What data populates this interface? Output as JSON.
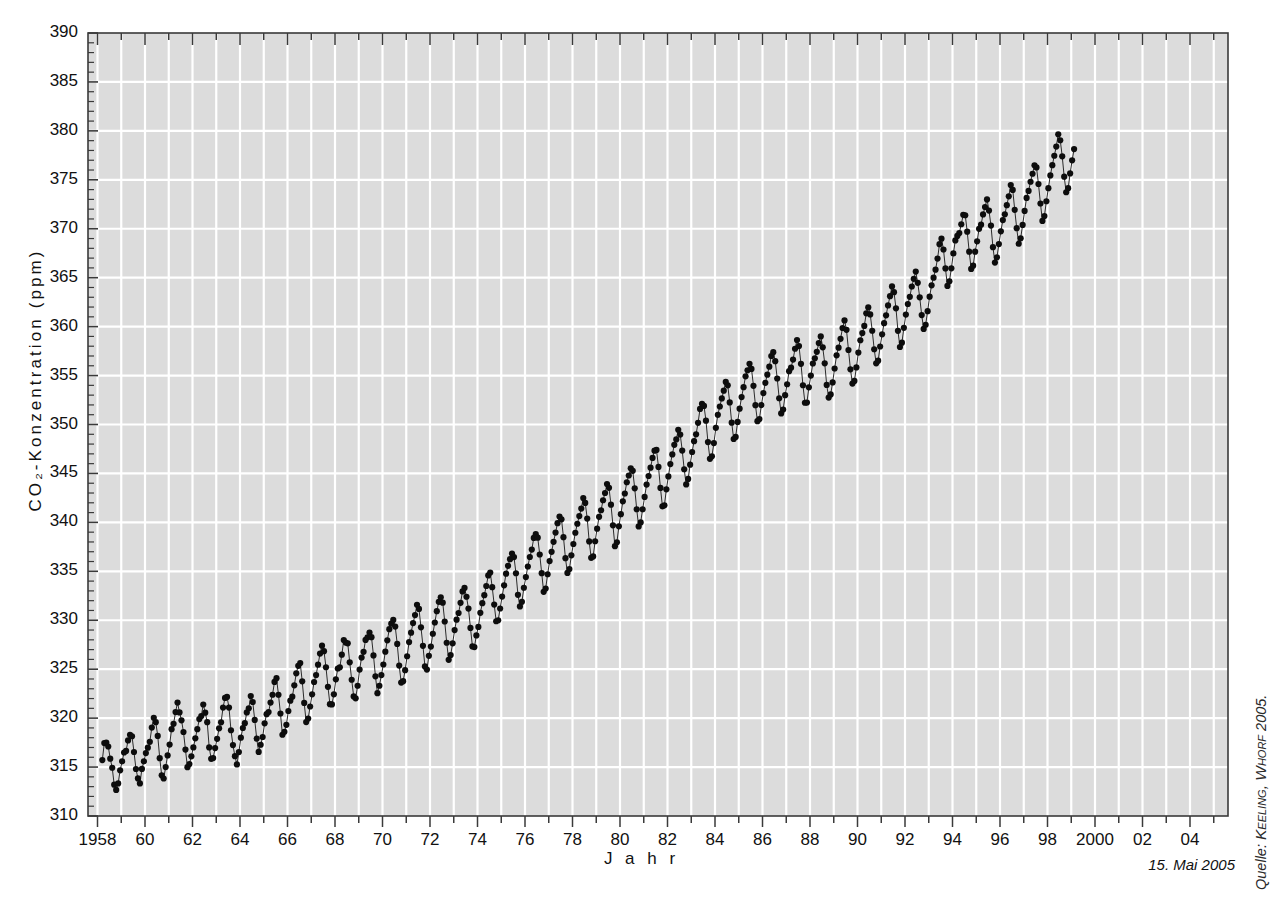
{
  "axes": {
    "y_title": "CO₂-Konzentration (ppm)",
    "x_title": "J a h r",
    "y_min": 310,
    "y_max": 390,
    "y_step": 5,
    "y_minor_step": 1,
    "y_ticks": [
      "310",
      "315",
      "320",
      "325",
      "330",
      "335",
      "340",
      "345",
      "350",
      "355",
      "360",
      "365",
      "370",
      "375",
      "380",
      "385",
      "390"
    ],
    "x_min": 1957.6,
    "x_max": 2005.6,
    "x_tick_years": [
      1958,
      1959,
      1960,
      1961,
      1962,
      1963,
      1964,
      1965,
      1966,
      1967,
      1968,
      1969,
      1970,
      1971,
      1972,
      1973,
      1974,
      1975,
      1976,
      1977,
      1978,
      1979,
      1980,
      1981,
      1982,
      1983,
      1984,
      1985,
      1986,
      1987,
      1988,
      1989,
      1990,
      1991,
      1992,
      1993,
      1994,
      1995,
      1996,
      1997,
      1998,
      1999,
      2000,
      2001,
      2002,
      2003,
      2004,
      2005
    ],
    "x_labeled": [
      {
        "year": 1958,
        "label": "1958"
      },
      {
        "year": 1960,
        "label": "60"
      },
      {
        "year": 1962,
        "label": "62"
      },
      {
        "year": 1964,
        "label": "64"
      },
      {
        "year": 1966,
        "label": "66"
      },
      {
        "year": 1968,
        "label": "68"
      },
      {
        "year": 1970,
        "label": "70"
      },
      {
        "year": 1972,
        "label": "72"
      },
      {
        "year": 1974,
        "label": "74"
      },
      {
        "year": 1976,
        "label": "76"
      },
      {
        "year": 1978,
        "label": "78"
      },
      {
        "year": 1980,
        "label": "80"
      },
      {
        "year": 1982,
        "label": "82"
      },
      {
        "year": 1984,
        "label": "84"
      },
      {
        "year": 1986,
        "label": "86"
      },
      {
        "year": 1988,
        "label": "88"
      },
      {
        "year": 1990,
        "label": "90"
      },
      {
        "year": 1992,
        "label": "92"
      },
      {
        "year": 1994,
        "label": "94"
      },
      {
        "year": 1996,
        "label": "96"
      },
      {
        "year": 1998,
        "label": "98"
      },
      {
        "year": 2000,
        "label": "2000"
      },
      {
        "year": 2002,
        "label": "02"
      },
      {
        "year": 2004,
        "label": "04"
      }
    ]
  },
  "annotations": {
    "datestamp": "15. Mai 2005",
    "source_prefix": "Quelle: ",
    "source_names": "Keeling, Whorf",
    "source_year": " 2005."
  },
  "style": {
    "plot_background": "#dcdcdc",
    "gridline_color": "#ffffff",
    "axis_color": "#3a3a3a",
    "marker_color": "#0d0d0d",
    "line_color": "#2b2b2b",
    "page_background": "#ffffff"
  },
  "chart_data": {
    "type": "line",
    "title": "",
    "xlabel": "Jahr",
    "ylabel": "CO₂-Konzentration (ppm)",
    "xlim": [
      1957.6,
      2005.6
    ],
    "ylim": [
      310,
      390
    ],
    "grid": true,
    "legend": null,
    "series_name": "Monatliche CO₂-Konzentration (Mauna Loa)",
    "x_start_decimal": 1958.203,
    "sampling": "monthly",
    "annual_means": [
      {
        "year": 1958,
        "value": 315.3
      },
      {
        "year": 1959,
        "value": 315.98
      },
      {
        "year": 1960,
        "value": 316.91
      },
      {
        "year": 1961,
        "value": 317.64
      },
      {
        "year": 1962,
        "value": 318.45
      },
      {
        "year": 1963,
        "value": 318.99
      },
      {
        "year": 1964,
        "value": 319.62
      },
      {
        "year": 1965,
        "value": 320.04
      },
      {
        "year": 1966,
        "value": 321.38
      },
      {
        "year": 1967,
        "value": 322.16
      },
      {
        "year": 1968,
        "value": 323.04
      },
      {
        "year": 1969,
        "value": 324.62
      },
      {
        "year": 1970,
        "value": 325.68
      },
      {
        "year": 1971,
        "value": 326.32
      },
      {
        "year": 1972,
        "value": 327.45
      },
      {
        "year": 1973,
        "value": 329.68
      },
      {
        "year": 1974,
        "value": 330.18
      },
      {
        "year": 1975,
        "value": 331.11
      },
      {
        "year": 1976,
        "value": 332.04
      },
      {
        "year": 1977,
        "value": 333.83
      },
      {
        "year": 1978,
        "value": 335.4
      },
      {
        "year": 1979,
        "value": 336.84
      },
      {
        "year": 1980,
        "value": 338.75
      },
      {
        "year": 1981,
        "value": 340.11
      },
      {
        "year": 1982,
        "value": 341.45
      },
      {
        "year": 1983,
        "value": 343.05
      },
      {
        "year": 1984,
        "value": 344.65
      },
      {
        "year": 1985,
        "value": 346.12
      },
      {
        "year": 1986,
        "value": 347.42
      },
      {
        "year": 1987,
        "value": 349.19
      },
      {
        "year": 1988,
        "value": 351.57
      },
      {
        "year": 1989,
        "value": 353.12
      },
      {
        "year": 1990,
        "value": 354.39
      },
      {
        "year": 1991,
        "value": 355.61
      },
      {
        "year": 1992,
        "value": 356.45
      },
      {
        "year": 1993,
        "value": 357.1
      },
      {
        "year": 1994,
        "value": 358.83
      },
      {
        "year": 1995,
        "value": 360.82
      },
      {
        "year": 1996,
        "value": 362.61
      },
      {
        "year": 1997,
        "value": 363.73
      },
      {
        "year": 1998,
        "value": 366.7
      },
      {
        "year": 1999,
        "value": 368.38
      },
      {
        "year": 2000,
        "value": 369.55
      },
      {
        "year": 2001,
        "value": 371.14
      },
      {
        "year": 2002,
        "value": 373.28
      },
      {
        "year": 2003,
        "value": 375.8
      },
      {
        "year": 2004,
        "value": 377.52
      },
      {
        "year": 2005,
        "value": 379.0
      }
    ],
    "seasonal_amplitude_ppm": 6.2,
    "seasonal_peak_month": 5,
    "seasonal_trough_month": 10,
    "values": [
      315.71,
      317.45,
      317.5,
      317.1,
      315.86,
      314.93,
      313.2,
      312.66,
      313.33,
      314.67,
      315.58,
      316.49,
      316.65,
      317.72,
      318.29,
      318.15,
      316.54,
      314.8,
      313.84,
      313.33,
      314.81,
      315.58,
      316.43,
      316.98,
      317.58,
      319.03,
      320.04,
      319.59,
      318.18,
      315.91,
      314.16,
      313.83,
      315.0,
      316.19,
      317.3,
      318.87,
      319.42,
      320.62,
      321.59,
      320.58,
      319.78,
      318.58,
      316.79,
      314.99,
      315.31,
      316.1,
      317.01,
      317.94,
      318.87,
      319.9,
      320.21,
      321.39,
      320.56,
      319.59,
      317.01,
      315.84,
      315.92,
      316.94,
      317.88,
      318.96,
      319.57,
      321.08,
      322.06,
      322.17,
      321.08,
      318.76,
      317.25,
      316.11,
      315.27,
      316.53,
      318.0,
      318.99,
      319.48,
      320.58,
      321.01,
      322.25,
      321.65,
      319.82,
      317.91,
      316.55,
      317.28,
      318.07,
      319.47,
      320.4,
      320.62,
      321.59,
      322.39,
      323.7,
      324.08,
      322.39,
      320.47,
      318.3,
      318.61,
      319.32,
      320.73,
      321.78,
      322.19,
      323.35,
      324.58,
      325.34,
      325.62,
      323.76,
      321.55,
      319.6,
      319.95,
      321.19,
      322.43,
      323.69,
      324.4,
      325.46,
      326.6,
      327.4,
      326.84,
      325.2,
      323.2,
      321.43,
      321.4,
      322.43,
      323.96,
      325.07,
      325.2,
      326.48,
      327.98,
      327.72,
      327.64,
      325.7,
      323.92,
      322.22,
      322.02,
      323.31,
      324.96,
      326.19,
      326.77,
      327.99,
      328.26,
      328.75,
      328.27,
      326.41,
      324.27,
      322.55,
      323.31,
      324.4,
      325.48,
      326.79,
      327.95,
      329.09,
      329.65,
      330.03,
      329.35,
      327.58,
      325.37,
      323.63,
      323.78,
      324.9,
      326.32,
      327.77,
      328.73,
      329.71,
      330.53,
      331.58,
      331.16,
      329.28,
      327.39,
      325.28,
      324.96,
      326.37,
      327.31,
      328.62,
      329.77,
      330.93,
      331.88,
      332.35,
      331.8,
      329.87,
      327.7,
      325.96,
      326.44,
      327.64,
      329.0,
      330.06,
      330.74,
      331.78,
      332.95,
      333.3,
      332.4,
      331.19,
      329.22,
      327.33,
      327.26,
      328.45,
      329.32,
      330.76,
      331.74,
      332.56,
      333.5,
      334.58,
      334.87,
      333.38,
      331.6,
      329.9,
      330.0,
      331.2,
      332.42,
      333.57,
      334.76,
      335.56,
      336.24,
      336.82,
      336.45,
      334.8,
      332.6,
      331.41,
      331.88,
      333.32,
      334.41,
      335.49,
      336.46,
      337.22,
      338.41,
      338.79,
      338.44,
      336.72,
      334.81,
      332.9,
      333.24,
      334.7,
      336.05,
      336.99,
      338.01,
      338.96,
      339.92,
      340.59,
      340.31,
      338.49,
      336.34,
      334.84,
      335.23,
      336.63,
      337.79,
      338.94,
      339.86,
      340.64,
      341.41,
      342.48,
      341.99,
      340.39,
      338.05,
      336.38,
      336.52,
      338.07,
      339.36,
      340.57,
      341.24,
      342.26,
      343.0,
      343.91,
      343.53,
      341.81,
      339.7,
      337.57,
      337.96,
      339.6,
      340.84,
      342.15,
      342.95,
      344.1,
      344.79,
      345.52,
      345.27,
      343.48,
      341.34,
      339.59,
      340.0,
      341.34,
      342.6,
      343.86,
      344.74,
      345.59,
      346.59,
      347.33,
      347.4,
      345.67,
      343.52,
      341.64,
      341.74,
      343.38,
      344.69,
      345.96,
      346.94,
      347.92,
      348.48,
      349.46,
      348.97,
      347.34,
      345.43,
      343.88,
      344.44,
      345.9,
      347.19,
      348.3,
      349.0,
      350.17,
      351.59,
      352.12,
      351.9,
      350.39,
      348.2,
      346.49,
      346.75,
      348.1,
      349.66,
      350.99,
      351.84,
      352.66,
      353.46,
      354.35,
      354.0,
      352.26,
      350.19,
      348.52,
      348.73,
      350.26,
      351.62,
      352.8,
      353.81,
      354.92,
      355.54,
      356.2,
      355.68,
      353.95,
      351.97,
      350.34,
      350.56,
      351.98,
      353.21,
      354.26,
      355.09,
      355.91,
      357.0,
      357.39,
      356.47,
      354.7,
      352.68,
      351.13,
      351.52,
      353.0,
      354.11,
      355.45,
      355.81,
      356.63,
      357.74,
      358.63,
      358.01,
      356.2,
      354.01,
      352.22,
      352.24,
      353.8,
      355.0,
      356.23,
      356.76,
      357.43,
      358.32,
      359.0,
      357.89,
      356.25,
      354.04,
      352.75,
      353.07,
      354.3,
      355.72,
      357.07,
      357.85,
      358.75,
      359.86,
      360.63,
      359.67,
      357.61,
      355.64,
      354.18,
      354.45,
      355.83,
      357.35,
      358.61,
      359.34,
      360.07,
      361.36,
      361.96,
      361.25,
      359.58,
      357.69,
      356.25,
      356.52,
      357.97,
      359.21,
      360.35,
      361.15,
      362.17,
      363.11,
      364.11,
      363.52,
      361.87,
      359.57,
      357.92,
      358.36,
      359.88,
      361.23,
      362.31,
      363.04,
      364.1,
      364.88,
      365.62,
      364.47,
      362.99,
      361.18,
      359.77,
      360.19,
      361.58,
      363.06,
      364.22,
      365.0,
      365.82,
      366.95,
      368.42,
      368.99,
      367.88,
      365.95,
      364.16,
      364.63,
      365.96,
      367.48,
      368.81,
      369.27,
      369.56,
      370.46,
      371.43,
      371.38,
      369.7,
      367.66,
      365.9,
      366.23,
      367.66,
      368.72,
      369.99,
      370.42,
      371.46,
      372.22,
      373.0,
      371.86,
      370.32,
      368.12,
      366.54,
      367.08,
      368.43,
      369.74,
      370.89,
      371.47,
      372.41,
      373.31,
      374.47,
      373.97,
      371.93,
      370.06,
      368.47,
      369.03,
      370.39,
      371.82,
      373.15,
      373.86,
      374.8,
      375.62,
      376.48,
      376.27,
      374.57,
      372.58,
      370.8,
      371.29,
      372.81,
      374.15,
      375.45,
      376.5,
      377.46,
      378.4,
      379.65,
      379.04,
      377.4,
      375.32,
      373.73,
      374.15,
      375.65,
      376.99,
      378.14
    ]
  }
}
